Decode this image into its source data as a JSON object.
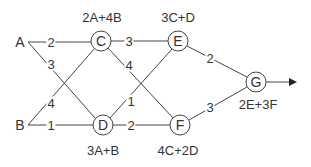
{
  "diagram": {
    "inputs": [
      {
        "id": "A",
        "label": "A"
      },
      {
        "id": "B",
        "label": "B"
      }
    ],
    "nodes": [
      {
        "id": "C",
        "label": "C",
        "formula": "2A+4B"
      },
      {
        "id": "D",
        "label": "D",
        "formula": "3A+B"
      },
      {
        "id": "E",
        "label": "E",
        "formula": "3C+D"
      },
      {
        "id": "F",
        "label": "F",
        "formula": "4C+2D"
      },
      {
        "id": "G",
        "label": "G",
        "formula": "2E+3F"
      }
    ],
    "edges": [
      {
        "from": "A",
        "to": "C",
        "weight": "2"
      },
      {
        "from": "A",
        "to": "D",
        "weight": "3"
      },
      {
        "from": "B",
        "to": "C",
        "weight": "4"
      },
      {
        "from": "B",
        "to": "D",
        "weight": "1"
      },
      {
        "from": "C",
        "to": "E",
        "weight": "3"
      },
      {
        "from": "C",
        "to": "F",
        "weight": "4"
      },
      {
        "from": "D",
        "to": "E",
        "weight": "1"
      },
      {
        "from": "D",
        "to": "F",
        "weight": "2"
      },
      {
        "from": "E",
        "to": "G",
        "weight": "2"
      },
      {
        "from": "F",
        "to": "G",
        "weight": "3"
      }
    ],
    "output_arrow": "arrow-right-icon",
    "colors": {
      "line": "#444444",
      "text": "#333333",
      "background": "#ffffff"
    }
  }
}
